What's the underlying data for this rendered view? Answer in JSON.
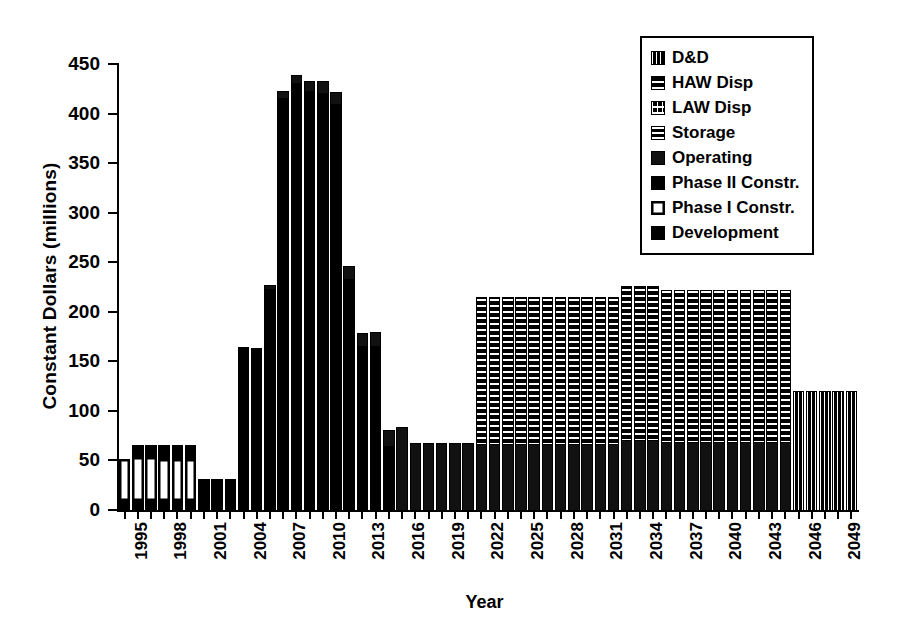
{
  "chart_data": {
    "type": "bar",
    "title": "",
    "subtitle": "",
    "xlabel": "Year",
    "ylabel": "Constant Dollars (millions)",
    "ylim": [
      0,
      450
    ],
    "ytick_values": [
      0,
      50,
      100,
      150,
      200,
      250,
      300,
      350,
      400,
      450
    ],
    "ytick_labels": [
      "0",
      "50",
      "100",
      "150",
      "200",
      "250",
      "300",
      "350",
      "400",
      "450"
    ],
    "grid": false,
    "stacked": true,
    "legend_position": "top-right",
    "legend": [
      {
        "label": "D&D",
        "fill": "dd"
      },
      {
        "label": "HAW Disp",
        "fill": "haw"
      },
      {
        "label": "LAW Disp",
        "fill": "law"
      },
      {
        "label": "Storage",
        "fill": "storage"
      },
      {
        "label": "Operating",
        "fill": "op"
      },
      {
        "label": "Phase II Constr.",
        "fill": "p2"
      },
      {
        "label": "Phase I Constr.",
        "fill": "p1"
      },
      {
        "label": "Development",
        "fill": "dev"
      }
    ],
    "x": [
      1995,
      1996,
      1997,
      1998,
      1999,
      2000,
      2001,
      2002,
      2003,
      2004,
      2005,
      2006,
      2007,
      2008,
      2009,
      2010,
      2011,
      2012,
      2013,
      2014,
      2015,
      2016,
      2017,
      2018,
      2019,
      2020,
      2021,
      2022,
      2023,
      2024,
      2025,
      2026,
      2027,
      2028,
      2029,
      2030,
      2031,
      2032,
      2033,
      2034,
      2035,
      2036,
      2037,
      2038,
      2039,
      2040,
      2041,
      2042,
      2043,
      2044,
      2045,
      2046,
      2047,
      2048,
      2049,
      2050
    ],
    "xtick_labels": [
      "1995",
      "1998",
      "2001",
      "2004",
      "2007",
      "2010",
      "2013",
      "2016",
      "2019",
      "2022",
      "2025",
      "2028",
      "2031",
      "2034",
      "2037",
      "2040",
      "2043",
      "2046",
      "2049"
    ],
    "xtick_years": [
      1995,
      1998,
      2001,
      2004,
      2007,
      2010,
      2013,
      2016,
      2019,
      2022,
      2025,
      2028,
      2031,
      2034,
      2037,
      2040,
      2043,
      2046,
      2049
    ],
    "totals": [
      50,
      65,
      65,
      65,
      65,
      65,
      30,
      30,
      30,
      163,
      162,
      226,
      422,
      438,
      432,
      432,
      421,
      245,
      178,
      179,
      80,
      83,
      67,
      67,
      67,
      67,
      67,
      214,
      214,
      214,
      214,
      214,
      214,
      214,
      214,
      214,
      214,
      214,
      225,
      225,
      221,
      221,
      221,
      221,
      221,
      221,
      221,
      221,
      221,
      221,
      119,
      119,
      119,
      119,
      119,
      119
    ],
    "bars": [
      {
        "year": 1995,
        "total": 50,
        "segments": [
          {
            "fill": "dev",
            "value": 10
          },
          {
            "fill": "p1",
            "value": 40
          }
        ]
      },
      {
        "year": 1996,
        "total": 65,
        "segments": [
          {
            "fill": "dev",
            "value": 10
          },
          {
            "fill": "p1",
            "value": 42
          },
          {
            "fill": "p2",
            "value": 13
          }
        ]
      },
      {
        "year": 1997,
        "total": 65,
        "segments": [
          {
            "fill": "dev",
            "value": 10
          },
          {
            "fill": "p1",
            "value": 42
          },
          {
            "fill": "p2",
            "value": 13
          }
        ]
      },
      {
        "year": 1998,
        "total": 65,
        "segments": [
          {
            "fill": "dev",
            "value": 10
          },
          {
            "fill": "p1",
            "value": 40
          },
          {
            "fill": "p2",
            "value": 15
          }
        ]
      },
      {
        "year": 1999,
        "total": 65,
        "segments": [
          {
            "fill": "dev",
            "value": 10
          },
          {
            "fill": "p1",
            "value": 40
          },
          {
            "fill": "p2",
            "value": 15
          }
        ]
      },
      {
        "year": 2000,
        "total": 65,
        "segments": [
          {
            "fill": "dev",
            "value": 10
          },
          {
            "fill": "p1",
            "value": 40
          },
          {
            "fill": "p2",
            "value": 15
          }
        ]
      },
      {
        "year": 2001,
        "total": 30,
        "segments": [
          {
            "fill": "dev",
            "value": 30
          }
        ]
      },
      {
        "year": 2002,
        "total": 30,
        "segments": [
          {
            "fill": "dev",
            "value": 30
          }
        ]
      },
      {
        "year": 2003,
        "total": 30,
        "segments": [
          {
            "fill": "dev",
            "value": 30
          }
        ]
      },
      {
        "year": 2004,
        "total": 163,
        "segments": [
          {
            "fill": "p2",
            "value": 163
          }
        ]
      },
      {
        "year": 2005,
        "total": 162,
        "segments": [
          {
            "fill": "p2",
            "value": 162
          }
        ]
      },
      {
        "year": 2006,
        "total": 226,
        "segments": [
          {
            "fill": "p2",
            "value": 222
          },
          {
            "fill": "op",
            "value": 4
          }
        ]
      },
      {
        "year": 2007,
        "total": 422,
        "segments": [
          {
            "fill": "p2",
            "value": 415
          },
          {
            "fill": "op",
            "value": 7
          }
        ]
      },
      {
        "year": 2008,
        "total": 438,
        "segments": [
          {
            "fill": "p2",
            "value": 430
          },
          {
            "fill": "op",
            "value": 8
          }
        ]
      },
      {
        "year": 2009,
        "total": 432,
        "segments": [
          {
            "fill": "p2",
            "value": 422
          },
          {
            "fill": "op",
            "value": 10
          }
        ]
      },
      {
        "year": 2010,
        "total": 432,
        "segments": [
          {
            "fill": "p2",
            "value": 420
          },
          {
            "fill": "op",
            "value": 12
          }
        ]
      },
      {
        "year": 2011,
        "total": 421,
        "segments": [
          {
            "fill": "p2",
            "value": 409
          },
          {
            "fill": "op",
            "value": 12
          }
        ]
      },
      {
        "year": 2012,
        "total": 245,
        "segments": [
          {
            "fill": "p2",
            "value": 232
          },
          {
            "fill": "op",
            "value": 13
          }
        ]
      },
      {
        "year": 2013,
        "total": 178,
        "segments": [
          {
            "fill": "p2",
            "value": 164
          },
          {
            "fill": "op",
            "value": 14
          }
        ]
      },
      {
        "year": 2014,
        "total": 179,
        "segments": [
          {
            "fill": "p2",
            "value": 164
          },
          {
            "fill": "op",
            "value": 15
          }
        ]
      },
      {
        "year": 2015,
        "total": 80,
        "segments": [
          {
            "fill": "p2",
            "value": 64
          },
          {
            "fill": "op",
            "value": 16
          }
        ]
      },
      {
        "year": 2016,
        "total": 83,
        "segments": [
          {
            "fill": "op",
            "value": 83
          }
        ]
      },
      {
        "year": 2017,
        "total": 67,
        "segments": [
          {
            "fill": "op",
            "value": 67
          }
        ]
      },
      {
        "year": 2018,
        "total": 67,
        "segments": [
          {
            "fill": "op",
            "value": 67
          }
        ]
      },
      {
        "year": 2019,
        "total": 67,
        "segments": [
          {
            "fill": "op",
            "value": 67
          }
        ]
      },
      {
        "year": 2020,
        "total": 67,
        "segments": [
          {
            "fill": "op",
            "value": 67
          }
        ]
      },
      {
        "year": 2021,
        "total": 67,
        "segments": [
          {
            "fill": "op",
            "value": 67
          }
        ]
      },
      {
        "year": 2022,
        "total": 214,
        "segments": [
          {
            "fill": "op",
            "value": 66
          },
          {
            "fill": "haw",
            "value": 148
          }
        ]
      },
      {
        "year": 2023,
        "total": 214,
        "segments": [
          {
            "fill": "op",
            "value": 66
          },
          {
            "fill": "haw",
            "value": 148
          }
        ]
      },
      {
        "year": 2024,
        "total": 214,
        "segments": [
          {
            "fill": "op",
            "value": 66
          },
          {
            "fill": "haw",
            "value": 148
          }
        ]
      },
      {
        "year": 2025,
        "total": 214,
        "segments": [
          {
            "fill": "op",
            "value": 66
          },
          {
            "fill": "haw",
            "value": 148
          }
        ]
      },
      {
        "year": 2026,
        "total": 214,
        "segments": [
          {
            "fill": "op",
            "value": 66
          },
          {
            "fill": "haw",
            "value": 148
          }
        ]
      },
      {
        "year": 2027,
        "total": 214,
        "segments": [
          {
            "fill": "op",
            "value": 66
          },
          {
            "fill": "haw",
            "value": 148
          }
        ]
      },
      {
        "year": 2028,
        "total": 214,
        "segments": [
          {
            "fill": "op",
            "value": 66
          },
          {
            "fill": "haw",
            "value": 148
          }
        ]
      },
      {
        "year": 2029,
        "total": 214,
        "segments": [
          {
            "fill": "op",
            "value": 66
          },
          {
            "fill": "haw",
            "value": 148
          }
        ]
      },
      {
        "year": 2030,
        "total": 214,
        "segments": [
          {
            "fill": "op",
            "value": 66
          },
          {
            "fill": "haw",
            "value": 148
          }
        ]
      },
      {
        "year": 2031,
        "total": 214,
        "segments": [
          {
            "fill": "op",
            "value": 66
          },
          {
            "fill": "haw",
            "value": 148
          }
        ]
      },
      {
        "year": 2032,
        "total": 214,
        "segments": [
          {
            "fill": "op",
            "value": 66
          },
          {
            "fill": "haw",
            "value": 148
          }
        ]
      },
      {
        "year": 2033,
        "total": 225,
        "segments": [
          {
            "fill": "op",
            "value": 70
          },
          {
            "fill": "haw",
            "value": 155
          }
        ]
      },
      {
        "year": 2034,
        "total": 225,
        "segments": [
          {
            "fill": "op",
            "value": 70
          },
          {
            "fill": "haw",
            "value": 155
          }
        ]
      },
      {
        "year": 2035,
        "total": 225,
        "segments": [
          {
            "fill": "op",
            "value": 70
          },
          {
            "fill": "haw",
            "value": 155
          }
        ]
      },
      {
        "year": 2036,
        "total": 221,
        "segments": [
          {
            "fill": "op",
            "value": 68
          },
          {
            "fill": "haw",
            "value": 153
          }
        ]
      },
      {
        "year": 2037,
        "total": 221,
        "segments": [
          {
            "fill": "op",
            "value": 68
          },
          {
            "fill": "haw",
            "value": 153
          }
        ]
      },
      {
        "year": 2038,
        "total": 221,
        "segments": [
          {
            "fill": "op",
            "value": 68
          },
          {
            "fill": "haw",
            "value": 153
          }
        ]
      },
      {
        "year": 2039,
        "total": 221,
        "segments": [
          {
            "fill": "op",
            "value": 68
          },
          {
            "fill": "haw",
            "value": 153
          }
        ]
      },
      {
        "year": 2040,
        "total": 221,
        "segments": [
          {
            "fill": "op",
            "value": 68
          },
          {
            "fill": "haw",
            "value": 153
          }
        ]
      },
      {
        "year": 2041,
        "total": 221,
        "segments": [
          {
            "fill": "op",
            "value": 68
          },
          {
            "fill": "haw",
            "value": 153
          }
        ]
      },
      {
        "year": 2042,
        "total": 221,
        "segments": [
          {
            "fill": "op",
            "value": 68
          },
          {
            "fill": "haw",
            "value": 153
          }
        ]
      },
      {
        "year": 2043,
        "total": 221,
        "segments": [
          {
            "fill": "op",
            "value": 68
          },
          {
            "fill": "haw",
            "value": 153
          }
        ]
      },
      {
        "year": 2044,
        "total": 221,
        "segments": [
          {
            "fill": "op",
            "value": 68
          },
          {
            "fill": "haw",
            "value": 153
          }
        ]
      },
      {
        "year": 2045,
        "total": 221,
        "segments": [
          {
            "fill": "op",
            "value": 68
          },
          {
            "fill": "haw",
            "value": 153
          }
        ]
      },
      {
        "year": 2046,
        "total": 119,
        "segments": [
          {
            "fill": "dd",
            "value": 119
          }
        ]
      },
      {
        "year": 2047,
        "total": 119,
        "segments": [
          {
            "fill": "dd",
            "value": 119
          }
        ]
      },
      {
        "year": 2048,
        "total": 119,
        "segments": [
          {
            "fill": "dd",
            "value": 119
          }
        ]
      },
      {
        "year": 2049,
        "total": 119,
        "segments": [
          {
            "fill": "dd",
            "value": 119
          }
        ]
      },
      {
        "year": 2050,
        "total": 119,
        "segments": [
          {
            "fill": "dd",
            "value": 119
          }
        ]
      }
    ]
  }
}
